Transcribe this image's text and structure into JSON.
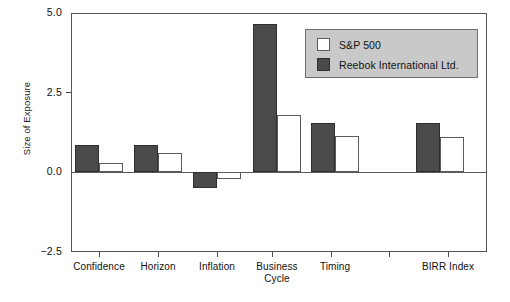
{
  "chart_data": {
    "type": "bar",
    "title": "",
    "xlabel": "",
    "ylabel": "Size of Exposure",
    "ylim": [
      -2.5,
      5.0
    ],
    "yticks": [
      5.0,
      2.5,
      0.0,
      -2.5
    ],
    "ytick_labels": [
      "5.0",
      "2.5",
      "0.0",
      "−2.5"
    ],
    "grid": false,
    "legend_position": "top-right",
    "categories": [
      "Confidence",
      "Horizon",
      "Inflation",
      "Business\nCycle",
      "Timing",
      "BIRR Index"
    ],
    "category_labels": [
      "Confidence",
      "Horizon",
      "Inflation",
      "Business\nCycle",
      "Timing",
      "BIRR Index"
    ],
    "series": [
      {
        "name": "Reebok International Ltd.",
        "color": "#4a4a4a",
        "values": [
          0.85,
          0.85,
          -0.5,
          4.65,
          1.55,
          1.55
        ]
      },
      {
        "name": "S&P 500",
        "color": "#ffffff",
        "values": [
          0.3,
          0.6,
          -0.2,
          1.8,
          1.15,
          1.1
        ]
      }
    ],
    "series_draw_order": [
      "Reebok International Ltd.",
      "S&P 500"
    ]
  },
  "legend": {
    "background_color": "#c9c9c9",
    "items": [
      {
        "label": "S&P 500",
        "swatch": "light"
      },
      {
        "label": "Reebok International Ltd.",
        "swatch": "dark"
      }
    ]
  },
  "axes": {
    "y_title": "Size of Exposure",
    "y_ticks": [
      "5.0",
      "2.5",
      "0.0",
      "−2.5"
    ],
    "x_ticks": [
      "Confidence",
      "Horizon",
      "Inflation",
      "Business\nCycle",
      "Timing",
      "BIRR Index"
    ]
  },
  "colors": {
    "bar_dark": "#4a4a4a",
    "bar_light": "#ffffff",
    "axis": "#555555",
    "legend_bg": "#c9c9c9",
    "text": "#111111"
  }
}
